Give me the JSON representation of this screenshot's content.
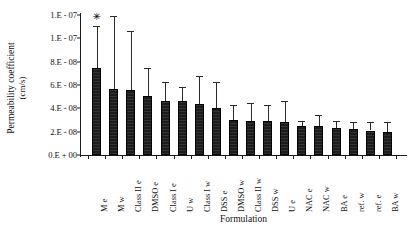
{
  "chart_data": {
    "type": "bar",
    "title": "",
    "xlabel": "Formulation",
    "ylabel": "Permeability coefficient (cm/s)",
    "ylabel_line1": "Permeability coefficient",
    "ylabel_line2": "(cm/s)",
    "ylim": [
      0,
      1.2e-07
    ],
    "grid": false,
    "legend": false,
    "ytick_values": [
      0,
      2e-08,
      4e-08,
      6e-08,
      8e-08,
      1e-07,
      1.2e-07
    ],
    "ytick_labels": [
      "0.E + 00",
      "2.E - 08",
      "4.E - 08",
      "6.E - 08",
      "8.E - 08",
      "1.E - 07",
      "1.E - 07"
    ],
    "categories": [
      "M e",
      "M w",
      "Class II e",
      "DMSO e",
      "Class I e",
      "U w",
      "Class I w",
      "DSS e",
      "DMSO w",
      "Class II w",
      "DSS w",
      "U e",
      "NAC e",
      "NAC w",
      "BA e",
      "ref. w",
      "ref. e",
      "BA w"
    ],
    "values": [
      7.5e-08,
      5.65e-08,
      5.6e-08,
      5.1e-08,
      4.65e-08,
      4.6e-08,
      4.4e-08,
      4e-08,
      3e-08,
      2.95e-08,
      2.9e-08,
      2.85e-08,
      2.5e-08,
      2.45e-08,
      2.3e-08,
      2.2e-08,
      2.1e-08,
      2e-08
    ],
    "errors": [
      3.6e-08,
      6.3e-08,
      5e-08,
      2.4e-08,
      1.6e-08,
      1.2e-08,
      2.4e-08,
      2.3e-08,
      1.3e-08,
      1.5e-08,
      1.4e-08,
      1.8e-08,
      4.5e-09,
      1e-08,
      6e-09,
      6.5e-09,
      7e-09,
      8e-09
    ],
    "annotations": [
      {
        "category": "M e",
        "text": "✳",
        "name": "significance-star"
      }
    ]
  }
}
